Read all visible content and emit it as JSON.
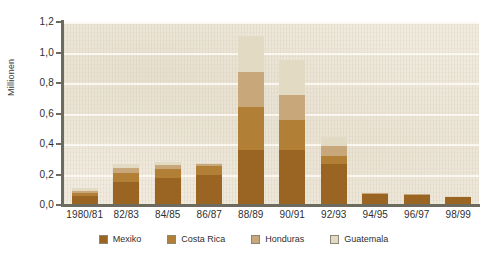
{
  "chart_data": {
    "type": "bar",
    "stacked": true,
    "title": "",
    "xlabel": "",
    "ylabel": "Millionen",
    "ylim": [
      0,
      1.2
    ],
    "ytick_labels": [
      "0,0",
      "0,2",
      "0,4",
      "0,6",
      "0,8",
      "1,0",
      "1,2"
    ],
    "ytick_values": [
      0.0,
      0.2,
      0.4,
      0.6,
      0.8,
      1.0,
      1.2
    ],
    "grid": true,
    "grid_axis": "y",
    "legend_position": "bottom",
    "categories": [
      "1980/81",
      "82/83",
      "84/85",
      "86/87",
      "88/89",
      "90/91",
      "92/93",
      "94/95",
      "96/97",
      "98/99"
    ],
    "series": [
      {
        "name": "Mexiko",
        "color": "#9a6422",
        "values": [
          0.06,
          0.15,
          0.18,
          0.2,
          0.36,
          0.36,
          0.27,
          0.07,
          0.065,
          0.05
        ]
      },
      {
        "name": "Costa Rica",
        "color": "#b27f36",
        "values": [
          0.02,
          0.06,
          0.055,
          0.055,
          0.28,
          0.2,
          0.05,
          0.005,
          0.003,
          0.003
        ]
      },
      {
        "name": "Honduras",
        "color": "#c8a87a",
        "values": [
          0.015,
          0.035,
          0.025,
          0.015,
          0.23,
          0.16,
          0.07,
          0.003,
          0.002,
          0.002
        ]
      },
      {
        "name": "Guatemala",
        "color": "#e2dac3",
        "values": [
          0.015,
          0.025,
          0.02,
          0.005,
          0.24,
          0.23,
          0.055,
          0.002,
          0.002,
          0.002
        ]
      }
    ],
    "totals": [
      0.11,
      0.27,
      0.28,
      0.275,
      1.11,
      0.95,
      0.445,
      0.08,
      0.072,
      0.057
    ]
  },
  "legend": {
    "items": [
      {
        "label": "Mexiko",
        "swatch": "mexiko"
      },
      {
        "label": "Costa Rica",
        "swatch": "costarica"
      },
      {
        "label": "Honduras",
        "swatch": "honduras"
      },
      {
        "label": "Guatemala",
        "swatch": "guatemala"
      }
    ]
  }
}
